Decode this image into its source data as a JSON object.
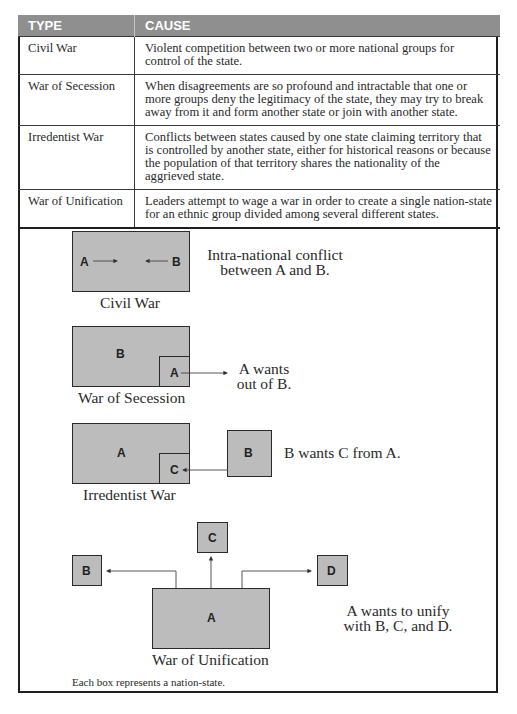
{
  "table": {
    "headers": [
      "TYPE",
      "CAUSE"
    ],
    "rows": [
      {
        "type": "Civil War",
        "cause": "Violent competition between two or more national groups for control of the state."
      },
      {
        "type": "War of Secession",
        "cause": "When disagreements are so profound and intractable that one or more groups deny the legitimacy of the state, they may try to break away from it and form another state or join with another state."
      },
      {
        "type": "Irredentist War",
        "cause": "Conflicts between states caused by one state claiming territory that is controlled by another state, either for historical reasons or because the population of that territory shares the nationality of the aggrieved state."
      },
      {
        "type": "War of Unification",
        "cause": "Leaders attempt to wage a war in order to create a single nation-state for an ethnic group divided among several different states."
      }
    ]
  },
  "diagrams": {
    "civil": {
      "caption": "Civil War",
      "label_a": "A",
      "label_b": "B",
      "desc_line1": "Intra-national conflict",
      "desc_line2": "between A and B."
    },
    "secession": {
      "caption": "War of Secession",
      "label_a": "A",
      "label_b": "B",
      "desc_line1": "A wants",
      "desc_line2": "out of B."
    },
    "irredentist": {
      "caption": "Irredentist War",
      "label_a": "A",
      "label_b": "B",
      "label_c": "C",
      "desc": "B wants C from A."
    },
    "unification": {
      "caption": "War of Unification",
      "label_a": "A",
      "label_b": "B",
      "label_c": "C",
      "label_d": "D",
      "desc_line1": "A wants to unify",
      "desc_line2": "with B, C, and D."
    }
  },
  "footnote": "Each box represents a nation-state.",
  "colors": {
    "header_bg": "#8f8f8f",
    "box_fill": "#bcbcbc",
    "border": "#1e1e1e"
  }
}
